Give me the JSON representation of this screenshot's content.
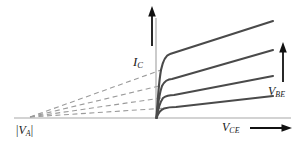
{
  "figure": {
    "background_color": "#ffffff",
    "width": 303,
    "height": 144
  },
  "axes": {
    "x_axis": {
      "name": "horizontal-axis",
      "color": "#a8a8a8",
      "x_start": 14,
      "x_end": 291,
      "y": 118
    },
    "y_axis": {
      "name": "vertical-axis",
      "color": "#a8a8a8",
      "x": 156,
      "y_start": 18,
      "y_end": 118
    }
  },
  "labels": {
    "y_axis_label": {
      "text": "I",
      "sub": "C"
    },
    "x_axis_label": {
      "text": "V",
      "sub": "CE"
    },
    "family_label": {
      "text": "V",
      "sub": "BE"
    },
    "early_voltage_label": {
      "open": "|",
      "text": "V",
      "sub": "A",
      "close": "|"
    }
  },
  "arrows": {
    "ic_arrow": {
      "name": "ic-up-arrow",
      "x": 152,
      "y_tail": 46,
      "y_head": 8,
      "color": "#111111"
    },
    "vce_arrow": {
      "name": "vce-right-arrow",
      "y": 128,
      "x_tail": 250,
      "x_head": 291,
      "color": "#111111"
    },
    "vbe_arrow": {
      "name": "vbe-up-arrow",
      "x": 283,
      "y_tail": 82,
      "y_head": 44,
      "color": "#111111"
    }
  },
  "chart_data": {
    "type": "line",
    "xlabel": "V_CE",
    "ylabel": "I_C",
    "legend": "V_BE increases upward",
    "grid": false,
    "origin_px": {
      "x": 156,
      "y": 118
    },
    "early_voltage_point_px": {
      "x": 30,
      "y": 117
    },
    "curve_color": "#4a4a4a",
    "dashed_color": "#9b9b9b",
    "curves": [
      {
        "name": "curve-1-highest-vbe",
        "knee_px": {
          "x": 170,
          "y": 54
        },
        "end_px": {
          "x": 273,
          "y": 21
        },
        "path": "M 156.5,118 C 157.5,104 158.5,84 161,70 C 163.5,58 166.5,55 170,54 L 273,21"
      },
      {
        "name": "curve-2",
        "knee_px": {
          "x": 172,
          "y": 79
        },
        "end_px": {
          "x": 273,
          "y": 50
        },
        "path": "M 156.5,118 C 157.5,108 159,94 162,86 C 165,80 168.5,79 172,79 L 273,50"
      },
      {
        "name": "curve-3",
        "knee_px": {
          "x": 174,
          "y": 95
        },
        "end_px": {
          "x": 273,
          "y": 76
        },
        "path": "M 156.5,118 C 157.5,112 159.5,103 163,98 C 166.5,95.5 170,95 174,95 L 273,76"
      },
      {
        "name": "curve-4-lowest-vbe",
        "knee_px": {
          "x": 176,
          "y": 107
        },
        "end_px": {
          "x": 273,
          "y": 96
        },
        "path": "M 156.5,118 C 157.5,115 160,110 164,108.5 C 168,107.3 172,107 176,107 L 273,96"
      }
    ],
    "dashed_extrapolations": [
      {
        "name": "dashed-1",
        "from_px": {
          "x": 30,
          "y": 117
        },
        "to_px": {
          "x": 161,
          "y": 70
        }
      },
      {
        "name": "dashed-2",
        "from_px": {
          "x": 30,
          "y": 117
        },
        "to_px": {
          "x": 163,
          "y": 85
        }
      },
      {
        "name": "dashed-3",
        "from_px": {
          "x": 30,
          "y": 117
        },
        "to_px": {
          "x": 165,
          "y": 97.5
        }
      },
      {
        "name": "dashed-4",
        "from_px": {
          "x": 30,
          "y": 117
        },
        "to_px": {
          "x": 167,
          "y": 108
        }
      }
    ]
  }
}
